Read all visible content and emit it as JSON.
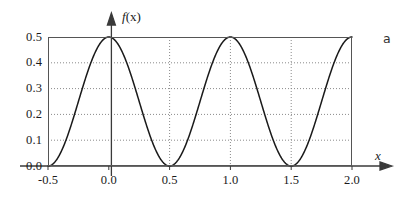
{
  "figure": {
    "panel_label": "a",
    "y_axis_title": "f(x)",
    "y_axis_title_var": "f",
    "y_axis_title_arg": "(x)",
    "x_axis_title": "x"
  },
  "chart_data": {
    "type": "line",
    "title": "",
    "subtitle": "",
    "xlabel": "x",
    "ylabel": "f(x)",
    "xlim": [
      -0.5,
      2.0
    ],
    "ylim": [
      0.0,
      0.5
    ],
    "xticks": [
      -0.5,
      0.0,
      0.5,
      1.0,
      1.5,
      2.0
    ],
    "xticklabels": [
      "-0.5",
      "0.0",
      "0.5",
      "1.0",
      "1.5",
      "2.0"
    ],
    "yticks": [
      0.0,
      0.1,
      0.2,
      0.3,
      0.4,
      0.5
    ],
    "yticklabels": [
      "0.0",
      "0.1",
      "0.2",
      "0.3",
      "0.4",
      "0.5"
    ],
    "grid": "dotted-both-axes",
    "legend": "none",
    "line_color": "#1a1a1a",
    "grid_color": "#8a8a8a",
    "axis_color": "#555555",
    "series": [
      {
        "name": "f(x)",
        "formula": "0.25*(1+cos(2*pi*x))",
        "period": 1.0,
        "amplitude": 0.5,
        "maxima_x": [
          0.0,
          1.0,
          2.0
        ],
        "maxima_y": [
          0.5,
          0.5,
          0.5
        ],
        "minima_x": [
          -0.5,
          0.5,
          1.5
        ],
        "minima_y": [
          0.0,
          0.0,
          0.0
        ],
        "x": [
          -0.5,
          -0.45,
          -0.4,
          -0.35,
          -0.3,
          -0.25,
          -0.2,
          -0.15,
          -0.1,
          -0.05,
          0.0,
          0.05,
          0.1,
          0.15,
          0.2,
          0.25,
          0.3,
          0.35,
          0.4,
          0.45,
          0.5,
          0.55,
          0.6,
          0.65,
          0.7,
          0.75,
          0.8,
          0.85,
          0.9,
          0.95,
          1.0,
          1.05,
          1.1,
          1.15,
          1.2,
          1.25,
          1.3,
          1.35,
          1.4,
          1.45,
          1.5,
          1.55,
          1.6,
          1.65,
          1.7,
          1.75,
          1.8,
          1.85,
          1.9,
          1.95,
          2.0
        ],
        "y": [
          0.0,
          0.006,
          0.024,
          0.052,
          0.088,
          0.125,
          0.163,
          0.198,
          0.226,
          0.244,
          0.25,
          0.244,
          0.226,
          0.198,
          0.163,
          0.125,
          0.088,
          0.052,
          0.024,
          0.006,
          0.0,
          0.006,
          0.024,
          0.052,
          0.088,
          0.125,
          0.163,
          0.198,
          0.226,
          0.244,
          0.25,
          0.244,
          0.226,
          0.198,
          0.163,
          0.125,
          0.088,
          0.052,
          0.024,
          0.006,
          0.0,
          0.006,
          0.024,
          0.052,
          0.088,
          0.125,
          0.163,
          0.198,
          0.226,
          0.244,
          0.25
        ]
      }
    ]
  }
}
